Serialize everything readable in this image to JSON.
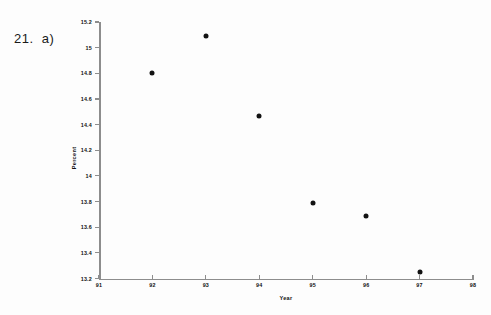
{
  "annotation": {
    "problem_label": "21.  a)"
  },
  "colors": {
    "background": "#fdfdfd",
    "axis": "#8d8d8d",
    "marker": "#121212",
    "text": "#111111"
  },
  "chart_data": {
    "type": "scatter",
    "title": "",
    "xlabel": "Year",
    "ylabel": "Percent",
    "x": [
      92,
      93,
      94,
      95,
      96,
      97
    ],
    "values": [
      14.8,
      15.09,
      14.47,
      13.79,
      13.69,
      13.25
    ],
    "points": [
      {
        "x": 92,
        "y": 14.8
      },
      {
        "x": 93,
        "y": 15.09
      },
      {
        "x": 94,
        "y": 14.47
      },
      {
        "x": 95,
        "y": 13.79
      },
      {
        "x": 96,
        "y": 13.69
      },
      {
        "x": 97,
        "y": 13.25
      }
    ],
    "xlim": [
      91,
      98
    ],
    "ylim": [
      13.2,
      15.2
    ],
    "xticks": [
      91,
      92,
      93,
      94,
      95,
      96,
      97,
      98
    ],
    "xticklabels": [
      "91",
      "92",
      "93",
      "94",
      "95",
      "96",
      "97",
      "98"
    ],
    "yticks": [
      13.2,
      13.4,
      13.6,
      13.8,
      14,
      14.2,
      14.4,
      14.6,
      14.8,
      15,
      15.2
    ],
    "yticklabels": [
      "13.2",
      "13.4",
      "13.6",
      "13.8",
      "14",
      "14.2",
      "14.4",
      "14.6",
      "14.8",
      "15",
      "15.2"
    ],
    "grid": false,
    "legend": null
  }
}
